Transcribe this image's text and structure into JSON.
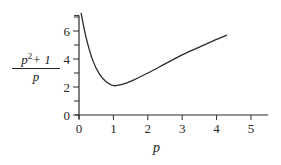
{
  "chart_data": {
    "type": "line",
    "title": "",
    "xlabel": "p",
    "ylabel": "(p^2+1)/p",
    "ylabel_parts": {
      "numerator_base": "p",
      "numerator_exp": "2",
      "numerator_rest": "+ 1",
      "denominator": "p"
    },
    "xlim": [
      0,
      5.5
    ],
    "ylim": [
      0,
      7.1
    ],
    "x_ticks": [
      "0",
      "1",
      "2",
      "3",
      "4",
      "5"
    ],
    "y_ticks": [
      "0",
      "2",
      "4",
      "6"
    ],
    "y_minor_ticks": [
      1,
      3,
      5,
      7
    ],
    "grid": false,
    "legend": null,
    "series": [
      {
        "name": "(p^2+1)/p",
        "x": [
          0.06,
          0.2,
          0.4,
          0.6,
          0.8,
          1.0,
          1.2,
          1.5,
          2.0,
          2.5,
          3.0,
          3.5,
          4.0,
          4.3
        ],
        "values": [
          7.3,
          5.6,
          3.9,
          2.9,
          2.35,
          2.1,
          2.15,
          2.4,
          3.0,
          3.65,
          4.3,
          4.85,
          5.4,
          5.7
        ]
      }
    ]
  }
}
